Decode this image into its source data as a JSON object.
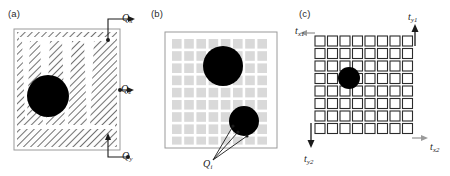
{
  "figure": {
    "width": 450,
    "height": 176,
    "background": "#ffffff",
    "panel_count": 3
  },
  "panels": [
    {
      "id": "a",
      "label": "(a)",
      "description": "hatched square domain with vertical tapered channels and circular inclusion",
      "border_color": "#8a8a8a",
      "hatch_color": "#4d4d4d",
      "inclusion_color": "#000000",
      "channels": 4,
      "inclusion": {
        "cx": 48,
        "cy": 96,
        "r": 21
      },
      "arrows": [
        {
          "name": "Qx",
          "label": "Q",
          "sub": "x",
          "position": "top-right",
          "direction": "right"
        },
        {
          "name": "Qz",
          "label": "Q",
          "sub": "z",
          "position": "middle-right",
          "direction": "right"
        },
        {
          "name": "Qy",
          "label": "Q",
          "sub": "y",
          "position": "bottom-right",
          "direction": "right"
        }
      ]
    },
    {
      "id": "b",
      "label": "(b)",
      "description": "grid of light gray square cells with two black circular inclusions",
      "border_color": "#8a8a8a",
      "cell_color": "#d9d9d9",
      "grid_rows": 9,
      "grid_cols": 9,
      "inclusions": [
        {
          "cx": 80,
          "cy": 66,
          "r": 20
        },
        {
          "cx": 101,
          "cy": 121,
          "r": 15
        }
      ],
      "callout": {
        "name": "Qi",
        "label": "Q",
        "sub": "i"
      }
    },
    {
      "id": "c",
      "label": "(c)",
      "description": "lattice mesh of outlined square cells with one black circular inclusion and four boundary traction arrows",
      "mesh_color": "#2b2b2b",
      "mesh_fill": "#ffffff",
      "grid_rows": 9,
      "grid_cols": 9,
      "inclusion": {
        "cx": 56,
        "cy": 78,
        "r": 11
      },
      "arrows": [
        {
          "name": "tx1",
          "label": "t",
          "sub": "x1",
          "direction": "left",
          "color": "#9a9a9a"
        },
        {
          "name": "ty1",
          "label": "t",
          "sub": "y1",
          "direction": "up",
          "color": "#1a1a1a"
        },
        {
          "name": "tx2",
          "label": "t",
          "sub": "x2",
          "direction": "right",
          "color": "#9a9a9a"
        },
        {
          "name": "ty2",
          "label": "t",
          "sub": "y2",
          "direction": "down",
          "color": "#1a1a1a"
        }
      ]
    }
  ]
}
